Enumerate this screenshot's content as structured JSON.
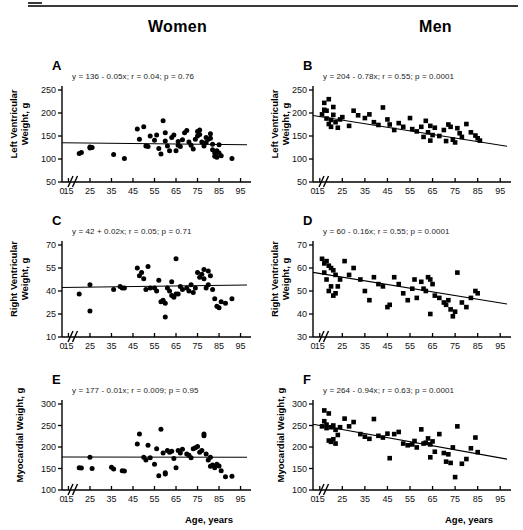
{
  "figure": {
    "column_titles": [
      "Women",
      "Men"
    ],
    "x_axis_label": "Age, years",
    "x_ticks": [
      0,
      15,
      25,
      35,
      45,
      55,
      65,
      75,
      85,
      95
    ],
    "axis_break": "//",
    "line_color": "#000000",
    "marker_color": "#000000"
  },
  "chart_data": [
    {
      "type": "scatter",
      "panel": "A",
      "group": "Women",
      "title": "",
      "annotation": "y = 136 - 0.05x;  r = 0.04;  p = 0.76",
      "equation": "y = 136 - 0.05x",
      "r": 0.04,
      "p": 0.76,
      "intercept": 136,
      "slope": -0.05,
      "marker": "circle",
      "xlabel": "Age, years",
      "ylabel": "Left Ventricular Weight, g",
      "ylabel_lines": [
        "Left Ventricular",
        "Weight, g"
      ],
      "xlim": [
        12,
        98
      ],
      "ylim": [
        50,
        250
      ],
      "yticks": [
        50,
        100,
        150,
        200,
        250
      ],
      "xticks": [
        0,
        15,
        25,
        35,
        45,
        55,
        65,
        75,
        85,
        95
      ],
      "grid": false,
      "x": [
        20,
        21,
        25,
        25,
        26,
        36,
        41,
        47,
        48,
        50,
        51,
        52,
        53,
        55,
        56,
        57,
        58,
        59,
        60,
        60,
        61,
        62,
        63,
        64,
        65,
        66,
        66,
        67,
        68,
        69,
        70,
        71,
        72,
        73,
        74,
        75,
        75,
        76,
        76,
        77,
        78,
        79,
        79,
        80,
        81,
        81,
        82,
        82,
        83,
        83,
        84,
        84,
        85,
        85,
        86,
        91
      ],
      "y": [
        112,
        114,
        124,
        126,
        125,
        110,
        101,
        165,
        143,
        170,
        128,
        127,
        150,
        141,
        152,
        123,
        111,
        183,
        157,
        139,
        128,
        118,
        147,
        152,
        118,
        138,
        130,
        127,
        142,
        157,
        162,
        137,
        130,
        122,
        143,
        160,
        150,
        163,
        153,
        137,
        128,
        147,
        136,
        143,
        155,
        145,
        132,
        120,
        113,
        106,
        118,
        104,
        131,
        113,
        107,
        101
      ]
    },
    {
      "type": "scatter",
      "panel": "B",
      "group": "Men",
      "title": "",
      "annotation": "y = 204 - 0.78x;  r = 0.55;  p = 0.0001",
      "equation": "y = 204 - 0.78x",
      "r": 0.55,
      "p": 0.0001,
      "intercept": 204,
      "slope": -0.78,
      "marker": "square",
      "xlabel": "Age, years",
      "ylabel": "Left Ventricular Weight, g",
      "ylabel_lines": [
        "Left Ventricular",
        "Weight, g"
      ],
      "xlim": [
        12,
        98
      ],
      "ylim": [
        50,
        250
      ],
      "yticks": [
        50,
        100,
        150,
        200,
        250
      ],
      "xticks": [
        0,
        15,
        25,
        35,
        45,
        55,
        65,
        75,
        85,
        95
      ],
      "grid": false,
      "x": [
        16,
        17,
        17,
        18,
        18,
        19,
        19,
        20,
        20,
        21,
        21,
        22,
        23,
        24,
        25,
        28,
        30,
        32,
        35,
        37,
        39,
        41,
        43,
        45,
        46,
        48,
        50,
        52,
        55,
        56,
        58,
        60,
        61,
        62,
        63,
        64,
        64,
        65,
        66,
        68,
        70,
        71,
        72,
        73,
        74,
        75,
        76,
        77,
        78,
        80,
        82,
        84,
        85,
        86
      ],
      "y": [
        197,
        222,
        207,
        205,
        188,
        230,
        176,
        185,
        170,
        213,
        196,
        180,
        168,
        186,
        191,
        172,
        205,
        195,
        189,
        197,
        180,
        174,
        212,
        186,
        175,
        163,
        178,
        170,
        189,
        165,
        160,
        170,
        148,
        183,
        158,
        172,
        140,
        152,
        168,
        150,
        163,
        139,
        175,
        170,
        142,
        136,
        167,
        156,
        148,
        176,
        158,
        151,
        145,
        140
      ]
    },
    {
      "type": "scatter",
      "panel": "C",
      "group": "Women",
      "title": "",
      "annotation": "y = 42 + 0.02x;  r = 0.05;  p = 0.71",
      "equation": "y = 42 + 0.02x",
      "r": 0.05,
      "p": 0.71,
      "intercept": 42,
      "slope": 0.02,
      "marker": "circle",
      "xlabel": "Age, years",
      "ylabel": "Right Ventricular Weight, g",
      "ylabel_lines": [
        "Right Ventricular",
        "Weight, g"
      ],
      "xlim": [
        12,
        98
      ],
      "ylim": [
        10,
        70
      ],
      "yticks": [
        10,
        25,
        40,
        55,
        70
      ],
      "xticks": [
        0,
        15,
        25,
        35,
        45,
        55,
        65,
        75,
        85,
        95
      ],
      "grid": false,
      "x": [
        20,
        25,
        25,
        36,
        39,
        40,
        41,
        47,
        48,
        49,
        50,
        51,
        52,
        53,
        55,
        56,
        57,
        58,
        59,
        60,
        60,
        61,
        62,
        63,
        63,
        64,
        65,
        65,
        66,
        67,
        68,
        70,
        71,
        72,
        73,
        74,
        75,
        76,
        77,
        78,
        78,
        79,
        80,
        80,
        81,
        82,
        83,
        84,
        85,
        86,
        88,
        91
      ],
      "y": [
        38,
        44,
        27,
        41,
        43,
        42,
        42,
        55,
        50,
        52,
        48,
        41,
        56,
        42,
        42,
        40,
        47,
        33,
        34,
        32,
        23,
        42,
        40,
        46,
        37,
        36,
        38,
        61,
        38,
        43,
        41,
        42,
        40,
        44,
        39,
        42,
        52,
        49,
        51,
        54,
        48,
        42,
        53,
        44,
        50,
        41,
        35,
        30,
        29,
        33,
        32,
        35
      ]
    },
    {
      "type": "scatter",
      "panel": "D",
      "group": "Men",
      "title": "",
      "annotation": "y = 60 - 0.16x;  r = 0.55;  p = 0.0001",
      "equation": "y = 60 - 0.16x",
      "r": 0.55,
      "p": 0.0001,
      "intercept": 60,
      "slope": -0.16,
      "marker": "square",
      "xlabel": "Age, years",
      "ylabel": "Right Ventricular Weight, g",
      "ylabel_lines": [
        "Right Ventricular",
        "Weight, g"
      ],
      "xlim": [
        12,
        98
      ],
      "ylim": [
        30,
        70
      ],
      "yticks": [
        30,
        40,
        50,
        60,
        70
      ],
      "xticks": [
        0,
        15,
        25,
        35,
        45,
        55,
        65,
        75,
        85,
        95
      ],
      "grid": false,
      "x": [
        16,
        17,
        17,
        18,
        18,
        19,
        19,
        20,
        20,
        21,
        21,
        22,
        22,
        23,
        24,
        26,
        28,
        30,
        33,
        35,
        37,
        39,
        41,
        43,
        45,
        46,
        48,
        50,
        52,
        54,
        56,
        57,
        58,
        60,
        61,
        62,
        63,
        64,
        64,
        65,
        66,
        68,
        70,
        71,
        72,
        73,
        74,
        75,
        76,
        78,
        80,
        82,
        84,
        85
      ],
      "y": [
        64,
        62,
        58,
        63,
        55,
        61,
        50,
        60,
        52,
        59,
        48,
        57,
        49,
        52,
        55,
        63,
        57,
        60,
        55,
        50,
        46,
        56,
        53,
        52,
        43,
        44,
        56,
        53,
        49,
        46,
        51,
        55,
        47,
        54,
        51,
        50,
        56,
        55,
        40,
        53,
        48,
        47,
        45,
        44,
        46,
        42,
        39,
        41,
        58,
        45,
        43,
        47,
        50,
        49
      ]
    },
    {
      "type": "scatter",
      "panel": "E",
      "group": "Women",
      "title": "",
      "annotation": "y = 177 - 0.01x;  r = 0.009;  p = 0.95",
      "equation": "y = 177 - 0.01x",
      "r": 0.009,
      "p": 0.95,
      "intercept": 177,
      "slope": -0.01,
      "marker": "circle",
      "xlabel": "Age, years",
      "ylabel": "Myocardial Weight, g",
      "ylabel_lines": [
        "Myocardial Weight, g"
      ],
      "xlim": [
        12,
        98
      ],
      "ylim": [
        100,
        300
      ],
      "yticks": [
        100,
        150,
        200,
        250,
        300
      ],
      "xticks": [
        0,
        15,
        25,
        35,
        45,
        55,
        65,
        75,
        85,
        95
      ],
      "grid": false,
      "x": [
        20,
        21,
        25,
        26,
        35,
        36,
        40,
        41,
        47,
        48,
        50,
        51,
        52,
        53,
        55,
        56,
        57,
        58,
        59,
        60,
        60,
        61,
        62,
        63,
        64,
        65,
        66,
        67,
        68,
        70,
        71,
        72,
        73,
        74,
        75,
        76,
        77,
        78,
        78,
        79,
        80,
        81,
        81,
        82,
        83,
        84,
        85,
        86,
        88,
        91
      ],
      "y": [
        152,
        151,
        176,
        150,
        153,
        149,
        145,
        144,
        207,
        230,
        176,
        170,
        204,
        175,
        160,
        196,
        133,
        241,
        186,
        140,
        137,
        192,
        188,
        190,
        173,
        152,
        192,
        186,
        195,
        184,
        181,
        175,
        196,
        198,
        201,
        188,
        192,
        226,
        230,
        184,
        170,
        176,
        155,
        158,
        152,
        160,
        156,
        145,
        131,
        132
      ]
    },
    {
      "type": "scatter",
      "panel": "F",
      "group": "Men",
      "title": "",
      "annotation": "y = 264 - 0.94x;  r = 0.63;  p = 0.0001",
      "equation": "y = 264 - 0.94x",
      "r": 0.63,
      "p": 0.0001,
      "intercept": 264,
      "slope": -0.94,
      "marker": "square",
      "xlabel": "Age, years",
      "ylabel": "Myocardial Weight, g",
      "ylabel_lines": [
        "Myocardial Weight, g"
      ],
      "xlim": [
        12,
        98
      ],
      "ylim": [
        100,
        300
      ],
      "yticks": [
        100,
        150,
        200,
        250,
        300
      ],
      "xticks": [
        0,
        15,
        25,
        35,
        45,
        55,
        65,
        75,
        85,
        95
      ],
      "grid": false,
      "x": [
        16,
        17,
        17,
        18,
        18,
        19,
        19,
        20,
        20,
        21,
        21,
        22,
        22,
        23,
        24,
        26,
        28,
        30,
        33,
        35,
        37,
        39,
        41,
        43,
        45,
        46,
        48,
        50,
        52,
        54,
        56,
        57,
        58,
        60,
        61,
        62,
        63,
        64,
        64,
        65,
        66,
        68,
        70,
        71,
        72,
        73,
        74,
        75,
        76,
        78,
        80,
        82,
        84,
        85
      ],
      "y": [
        248,
        285,
        260,
        252,
        244,
        278,
        215,
        246,
        212,
        250,
        218,
        240,
        208,
        228,
        246,
        266,
        248,
        258,
        230,
        224,
        219,
        265,
        226,
        222,
        231,
        174,
        230,
        235,
        208,
        204,
        206,
        214,
        199,
        241,
        208,
        210,
        220,
        206,
        176,
        213,
        189,
        230,
        186,
        166,
        183,
        163,
        199,
        130,
        248,
        161,
        172,
        197,
        222,
        188
      ]
    }
  ]
}
